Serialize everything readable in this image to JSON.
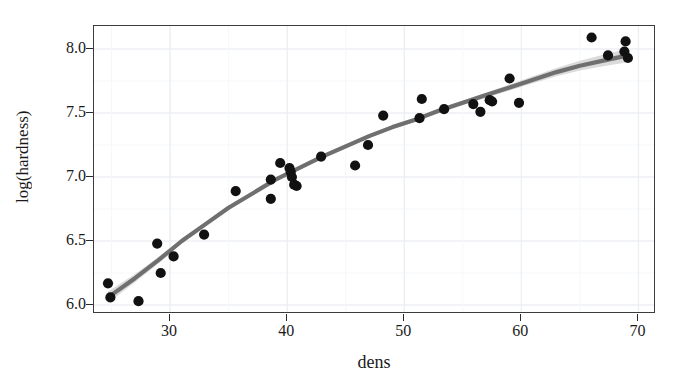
{
  "chart_data": {
    "type": "scatter",
    "title": "",
    "subtitle": "",
    "xlabel": "dens",
    "ylabel": "log(hardness)",
    "xlim": [
      23.5,
      71.5
    ],
    "ylim": [
      5.93,
      8.18
    ],
    "xticks": [
      30,
      40,
      50,
      60,
      70
    ],
    "xticklabels": [
      "30",
      "40",
      "50",
      "60",
      "70"
    ],
    "yticks": [
      6.0,
      6.5,
      7.0,
      7.5,
      8.0
    ],
    "yticklabels": [
      "6.0",
      "6.5",
      "7.0",
      "7.5",
      "8.0"
    ],
    "grid": true,
    "legend": "none",
    "point_color": "#111111",
    "line_color": "#6f6f6f",
    "ribbon_color": "#cfcfcf",
    "grid_color": "#eceff3",
    "panel_border_color": "#3c3c3c",
    "series": [
      {
        "name": "observations",
        "marker": "filled-circle",
        "points": [
          [
            24.7,
            6.17
          ],
          [
            24.9,
            6.06
          ],
          [
            27.3,
            6.03
          ],
          [
            28.9,
            6.48
          ],
          [
            29.2,
            6.25
          ],
          [
            30.3,
            6.38
          ],
          [
            32.9,
            6.55
          ],
          [
            35.6,
            6.89
          ],
          [
            38.6,
            6.98
          ],
          [
            38.6,
            6.83
          ],
          [
            39.4,
            7.11
          ],
          [
            40.2,
            7.07
          ],
          [
            40.3,
            7.04
          ],
          [
            40.4,
            7.0
          ],
          [
            40.6,
            6.94
          ],
          [
            40.8,
            6.93
          ],
          [
            42.9,
            7.16
          ],
          [
            45.8,
            7.09
          ],
          [
            46.9,
            7.25
          ],
          [
            48.2,
            7.48
          ],
          [
            51.3,
            7.46
          ],
          [
            51.5,
            7.61
          ],
          [
            53.4,
            7.53
          ],
          [
            55.9,
            7.57
          ],
          [
            56.5,
            7.51
          ],
          [
            57.3,
            7.6
          ],
          [
            57.5,
            7.59
          ],
          [
            59.0,
            7.77
          ],
          [
            59.8,
            7.58
          ],
          [
            66.0,
            8.09
          ],
          [
            67.4,
            7.95
          ],
          [
            68.8,
            7.98
          ],
          [
            68.9,
            8.06
          ],
          [
            69.1,
            7.93
          ]
        ]
      },
      {
        "name": "smooth-fit",
        "type": "line",
        "description": "GAM/loess smooth with 95% confidence ribbon",
        "fit": [
          [
            24.7,
            6.06
          ],
          [
            27.0,
            6.21
          ],
          [
            29.0,
            6.35
          ],
          [
            31.0,
            6.5
          ],
          [
            33.0,
            6.63
          ],
          [
            35.0,
            6.76
          ],
          [
            37.0,
            6.87
          ],
          [
            39.0,
            6.98
          ],
          [
            41.0,
            7.07
          ],
          [
            43.0,
            7.16
          ],
          [
            45.0,
            7.24
          ],
          [
            47.0,
            7.32
          ],
          [
            49.0,
            7.39
          ],
          [
            51.0,
            7.45
          ],
          [
            53.0,
            7.52
          ],
          [
            55.0,
            7.58
          ],
          [
            57.0,
            7.64
          ],
          [
            59.0,
            7.7
          ],
          [
            61.0,
            7.76
          ],
          [
            63.0,
            7.82
          ],
          [
            65.0,
            7.87
          ],
          [
            67.0,
            7.91
          ],
          [
            69.1,
            7.95
          ]
        ],
        "ribbon_halfwidth": [
          0.045,
          0.032,
          0.025,
          0.02,
          0.017,
          0.016,
          0.015,
          0.015,
          0.015,
          0.015,
          0.016,
          0.016,
          0.016,
          0.016,
          0.017,
          0.018,
          0.02,
          0.023,
          0.027,
          0.032,
          0.038,
          0.045,
          0.053
        ]
      }
    ]
  }
}
